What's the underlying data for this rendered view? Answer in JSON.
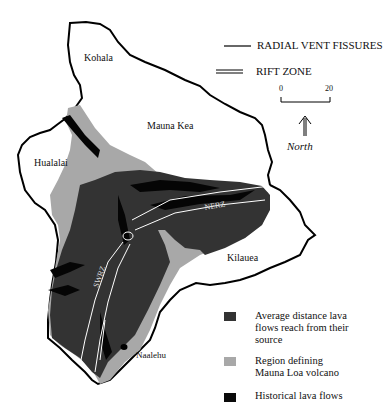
{
  "map": {
    "regions": [
      {
        "name": "Kohala",
        "x": 84,
        "y": 52
      },
      {
        "name": "Mauna Kea",
        "x": 147,
        "y": 120
      },
      {
        "name": "Hualalai",
        "x": 34,
        "y": 157
      },
      {
        "name": "Kilauea",
        "x": 227,
        "y": 252
      },
      {
        "name": "Naalehu",
        "x": 136,
        "y": 350
      }
    ],
    "rift_labels": {
      "nerz": "NERZ",
      "swrz": "SWRZ"
    }
  },
  "legend_lines": {
    "radial": "RADIAL VENT FISSURES",
    "rift": "RIFT ZONE"
  },
  "scale_bar": {
    "start": "0",
    "end": "20"
  },
  "north_label": "North",
  "key": [
    {
      "label": "Average distance lava flows reach from their source",
      "color": "#333333"
    },
    {
      "label": "Region defining Mauna Loa volcano",
      "color": "#a8a8a8"
    },
    {
      "label": "Historical lava flows",
      "color": "#0a0a0a"
    }
  ]
}
